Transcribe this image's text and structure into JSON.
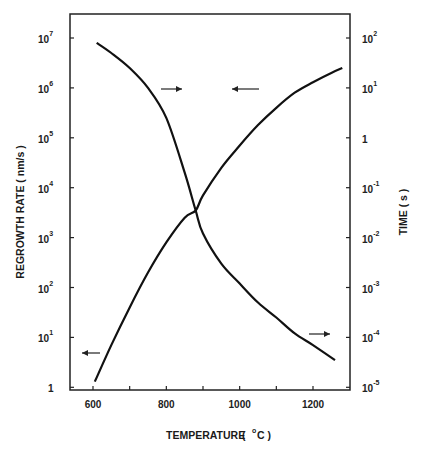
{
  "chart_data": {
    "type": "line",
    "title": "",
    "xlabel": "TEMPERATURE ( °C )",
    "ylabel": "REGROWTH RATE ( nm/s )",
    "y2label": "TIME ( s )",
    "xlim": [
      540,
      1310
    ],
    "ylim": [
      1,
      30000000
    ],
    "y2lim": [
      1e-05,
      300
    ],
    "yscale": "log",
    "y2scale": "log",
    "grid": false,
    "legend": "none (arrows indicate axis for each curve)",
    "x_ticks": [
      600,
      800,
      1000,
      1200
    ],
    "x_tick_labels": [
      "600",
      "800",
      "1000",
      "1200"
    ],
    "y_ticks": [
      {
        "base": "1",
        "exp": ""
      },
      {
        "base": "10",
        "exp": "1"
      },
      {
        "base": "10",
        "exp": "2"
      },
      {
        "base": "10",
        "exp": "3"
      },
      {
        "base": "10",
        "exp": "4"
      },
      {
        "base": "10",
        "exp": "5"
      },
      {
        "base": "10",
        "exp": "6"
      },
      {
        "base": "10",
        "exp": "7"
      }
    ],
    "y2_ticks": [
      {
        "base": "10",
        "exp": "-5"
      },
      {
        "base": "10",
        "exp": "-4"
      },
      {
        "base": "10",
        "exp": "-3"
      },
      {
        "base": "10",
        "exp": "-2"
      },
      {
        "base": "10",
        "exp": "-1"
      },
      {
        "base": "1",
        "exp": ""
      },
      {
        "base": "10",
        "exp": "1"
      },
      {
        "base": "10",
        "exp": "2"
      }
    ],
    "series": [
      {
        "name": "Regrowth rate",
        "axis": "left",
        "x": [
          605,
          650,
          700,
          750,
          800,
          850,
          880,
          900,
          950,
          1000,
          1050,
          1100,
          1150,
          1200,
          1250,
          1280
        ],
        "values": [
          1.3,
          7,
          40,
          200,
          800,
          2500,
          3500,
          7000,
          25000,
          70000,
          180000,
          400000,
          800000,
          1300000,
          2000000,
          2500000
        ]
      },
      {
        "name": "Time",
        "axis": "right",
        "x": [
          610,
          650,
          700,
          750,
          800,
          850,
          880,
          900,
          950,
          1000,
          1050,
          1100,
          1150,
          1200,
          1260
        ],
        "values": [
          80,
          50,
          25,
          10,
          2.5,
          0.2,
          0.035,
          0.012,
          0.003,
          0.0012,
          0.0005,
          0.00025,
          0.00012,
          7e-05,
          3.5e-05
        ]
      }
    ],
    "annotations": [
      {
        "type": "arrow",
        "direction": "right",
        "position": "near upper-left of Time curve",
        "points_to": "right axis"
      },
      {
        "type": "arrow",
        "direction": "left",
        "position": "near upper Regrowth curve",
        "points_to": "left axis"
      },
      {
        "type": "arrow",
        "direction": "left",
        "position": "lower-left near Regrowth start",
        "points_to": "left axis"
      },
      {
        "type": "arrow",
        "direction": "right",
        "position": "lower-right near Time end",
        "points_to": "right axis"
      }
    ]
  },
  "labels": {
    "x_axis_title": "TEMPERATURE",
    "x_axis_unit_open": "(",
    "x_axis_unit_deg": "o",
    "x_axis_unit": "C )",
    "y_axis_title": "REGROWTH RATE ( nm/s )",
    "y2_axis_title": "TIME ( s )"
  },
  "style": {
    "line_color": "#111111",
    "frame_color": "#222222"
  }
}
